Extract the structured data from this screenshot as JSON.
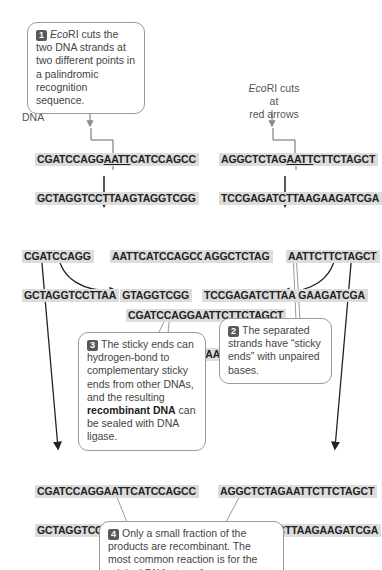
{
  "callouts": {
    "step1": {
      "number": "1",
      "enzyme": "Eco",
      "enzyme_suffix": "RI",
      "text": " cuts the two DNA strands at two different points in a palindromic recognition sequence."
    },
    "step2": {
      "number": "2",
      "text": "The separated strands have “sticky ends” with unpaired bases."
    },
    "step3": {
      "number": "3",
      "text_before": "The sticky ends can hydrogen-bond to complementary sticky ends from other DNAs, and the resulting ",
      "bold": "recombinant DNA",
      "text_after": " can be sealed with DNA ligase."
    },
    "step4": {
      "number": "4",
      "text": "Only a small fraction of the products are recombinant. The most common reaction is for the original DNAs to re-form."
    }
  },
  "labels": {
    "dna": "DNA",
    "ecori_note_italic": "Eco",
    "ecori_note_rest": "RI cuts at",
    "ecori_note_line2": "red arrows"
  },
  "sequences": {
    "original_left": {
      "top_a": "CGATCCAGG",
      "top_b": "AATT",
      "top_c": "CATCCAGCC",
      "bottom": "GCTAGGTCCTTAAGTAGGTCGG"
    },
    "original_right": {
      "top_a": "AGGCTCTAG",
      "top_b": "AATT",
      "top_c": "CTTCTAGCT",
      "bottom": "TCCGAGATCTTAAGAAGATCGA"
    },
    "cut_left_a": {
      "top": "CGATCCAGG",
      "bottom": "GCTAGGTCCTTAA"
    },
    "cut_left_b": {
      "top": "AATTCATCCAGCC",
      "bottom": "GTAGGTCGG"
    },
    "cut_right_a": {
      "top": "AGGCTCTAG",
      "bottom": "TCCGAGATCTTAA"
    },
    "cut_right_b": {
      "top": "AATTCTTCTAGCT",
      "bottom": "GAAGATCGA"
    },
    "recombinant": {
      "top": "CGATCCAGGAATTCTTCTAGCT",
      "bottom": "GCTAGGTCCTTAAGAAGATCGA"
    },
    "reformed_left": {
      "top": "CGATCCAGGAATTCATCCAGCC",
      "bottom": "GCTAGGTCCTTAAGTAGGTCGG"
    },
    "reformed_right": {
      "top": "AGGCTCTAGAATTCTTCTAGCT",
      "bottom": "TCCGAGATCTTAAGAAGATCGA"
    }
  },
  "colors": {
    "strand_bg": "#dcdcdc",
    "arrow": "#222222",
    "cut_arrow": "#8a8a8a",
    "badge": "#5a5a5a"
  }
}
